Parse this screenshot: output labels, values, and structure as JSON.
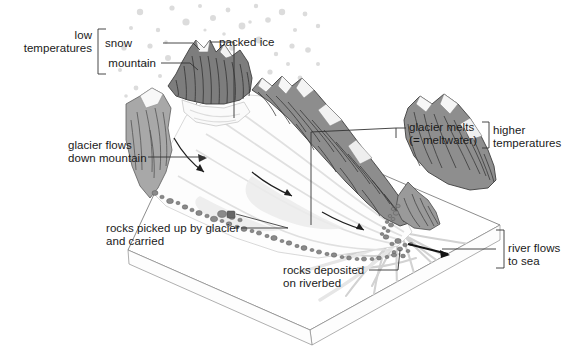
{
  "diagram": {
    "type": "earth-science-block-diagram",
    "colors": {
      "background": "#ffffff",
      "mountain_rock_dark": "#858585",
      "mountain_rock_mid": "#9b9b9b",
      "mountain_rock_light": "#b4b4b4",
      "snow_white": "#fbfbfb",
      "glacier_white": "#fdfdfd",
      "glacier_shadow": "#e2e2e2",
      "rock_debris": "#8c8c8c",
      "rock_debris_dark": "#6d6d6d",
      "snowflake_dot": "#dcdcdc",
      "outline": "#4a4a4a",
      "label_text": "#1a1a1a",
      "leader_line": "#333333",
      "river_gray": "#d0d0d0"
    },
    "labels": [
      {
        "name": "low-temperatures",
        "text": "low\ntemperatures",
        "x": 38,
        "y": 33,
        "align": "right",
        "bracket": "left-tall"
      },
      {
        "name": "snow",
        "text": "snow",
        "x": 133,
        "y": 37,
        "align": "right",
        "leader": "horizontal-right"
      },
      {
        "name": "mountain",
        "text": "mountain",
        "x": 107,
        "y": 57,
        "align": "right",
        "leader": "horizontal-right"
      },
      {
        "name": "packed-ice",
        "text": "packed ice",
        "x": 219,
        "y": 36,
        "align": "left",
        "leader": "corner-down"
      },
      {
        "name": "glacier-flows-down-mountain",
        "text": "glacier flows\ndown mountain",
        "x": 68,
        "y": 139,
        "align": "left",
        "leader": "horizontal-right-arrow"
      },
      {
        "name": "glacier-melts",
        "text": "glacier melts\n(= meltwater)",
        "x": 409,
        "y": 121,
        "align": "left",
        "leader": "corner-left"
      },
      {
        "name": "higher-temperatures",
        "text": "higher\ntemperatures",
        "x": 492,
        "y": 125,
        "align": "left",
        "bracket": "left-small"
      },
      {
        "name": "rocks-picked-up-by-glacier-and-carried",
        "text": "rocks picked up by glacier\nand carried",
        "x": 106,
        "y": 222,
        "align": "left",
        "leader": "horizontal-right"
      },
      {
        "name": "rocks-deposited-on-riverbed",
        "text": "rocks deposited\non riverbed",
        "x": 283,
        "y": 264,
        "align": "left",
        "leader": "horizontal-right"
      },
      {
        "name": "river-flows-to-sea",
        "text": "river flows\nto sea",
        "x": 500,
        "y": 243,
        "align": "left",
        "bracket": "left-tall-small"
      }
    ],
    "annotations": {
      "low_temperatures": "low temperatures",
      "higher_temperatures": "higher temperatures",
      "snow": "snow",
      "mountain": "mountain",
      "packed_ice": "packed ice",
      "glacier_flows": "glacier flows down mountain",
      "glacier_melts": "glacier melts (= meltwater)",
      "rocks_picked_up": "rocks picked up by glacier and carried",
      "rocks_deposited": "rocks deposited on riverbed",
      "river_flows": "river flows to sea"
    },
    "features": [
      {
        "name": "snowfall-dots",
        "description": "scattered light grey dots above the peaks representing falling snow",
        "count": 46
      },
      {
        "name": "mountain-peaks",
        "description": "dark grey hatched rocky peaks forming a cirque around the glacier head"
      },
      {
        "name": "glacier-surface",
        "description": "white tongue of ice flowing from the cirque down to lower right"
      },
      {
        "name": "moraine-rocks",
        "description": "chain of small grey rocks along the left/lower margin of the glacier",
        "count": 58
      },
      {
        "name": "flow-arrows",
        "description": "three curved black arrows indicating direction of ice flow",
        "count": 3
      },
      {
        "name": "river-arrow",
        "description": "straight black arrow showing river direction toward the sea"
      },
      {
        "name": "braided-river",
        "description": "pale grey braided outwash channels spreading across the plain"
      },
      {
        "name": "ground-block",
        "description": "3-D parallelogram block outline of the landscape"
      }
    ]
  }
}
